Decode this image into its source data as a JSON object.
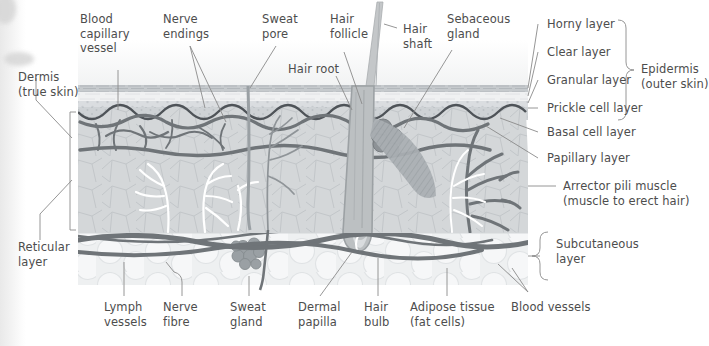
{
  "diagram": {
    "colors": {
      "text": "#4d4d4d",
      "leader_line": "#8a8a8a",
      "bracket": "#8a8a8a",
      "horny_layer": "#c9cdd0",
      "clear_layer": "#f2f3f4",
      "granular_layer": "#dcdfe1",
      "prickle_layer": "#cfd3d6",
      "basal_line": "#4e5358",
      "dermis_fill": "#d3d6d8",
      "subcutaneous_fill": "#eceeef",
      "blood_vessel": "#6f7478",
      "lymph_vessel": "#ffffff",
      "nerve": "#8f9498",
      "hair_shaft": "#b9bcbe",
      "sebaceous_gland": "#8d9296",
      "sweat_gland": "#9aa0a4",
      "arrector_muscle": "#a9aeb2"
    },
    "labels": {
      "top": [
        {
          "id": "blood-capillary-vessel",
          "text": "Blood\ncapillary\nvessel"
        },
        {
          "id": "nerve-endings",
          "text": "Nerve\nendings"
        },
        {
          "id": "sweat-pore",
          "text": "Sweat\npore"
        },
        {
          "id": "hair-follicle",
          "text": "Hair\nfollicle"
        },
        {
          "id": "hair-root",
          "text": "Hair root"
        },
        {
          "id": "hair-shaft",
          "text": "Hair\nshaft"
        },
        {
          "id": "sebaceous-gland",
          "text": "Sebaceous\ngland"
        }
      ],
      "left": [
        {
          "id": "dermis",
          "text": "Dermis\n(true skin)"
        },
        {
          "id": "reticular-layer",
          "text": "Reticular\nlayer"
        }
      ],
      "right_epidermis": [
        {
          "id": "horny-layer",
          "text": "Horny layer"
        },
        {
          "id": "clear-layer",
          "text": "Clear layer"
        },
        {
          "id": "granular-layer",
          "text": "Granular layer"
        },
        {
          "id": "prickle-cell-layer",
          "text": "Prickle cell layer"
        },
        {
          "id": "basal-cell-layer",
          "text": "Basal cell layer"
        },
        {
          "id": "papillary-layer",
          "text": "Papillary layer"
        }
      ],
      "right_groups": [
        {
          "id": "epidermis",
          "text": "Epidermis\n(outer skin)"
        },
        {
          "id": "subcutaneous-layer",
          "text": "Subcutaneous\nlayer"
        }
      ],
      "right_other": [
        {
          "id": "arrector-pili-muscle",
          "text": "Arrector pili muscle\n(muscle to erect hair)"
        }
      ],
      "bottom": [
        {
          "id": "lymph-vessels",
          "text": "Lymph\nvessels"
        },
        {
          "id": "nerve-fibre",
          "text": "Nerve\nfibre"
        },
        {
          "id": "sweat-gland",
          "text": "Sweat\ngland"
        },
        {
          "id": "dermal-papilla",
          "text": "Dermal\npapilla"
        },
        {
          "id": "hair-bulb",
          "text": "Hair\nbulb"
        },
        {
          "id": "adipose-tissue",
          "text": "Adipose tissue\n(fat cells)"
        },
        {
          "id": "blood-vessels",
          "text": "Blood vessels"
        }
      ]
    }
  }
}
